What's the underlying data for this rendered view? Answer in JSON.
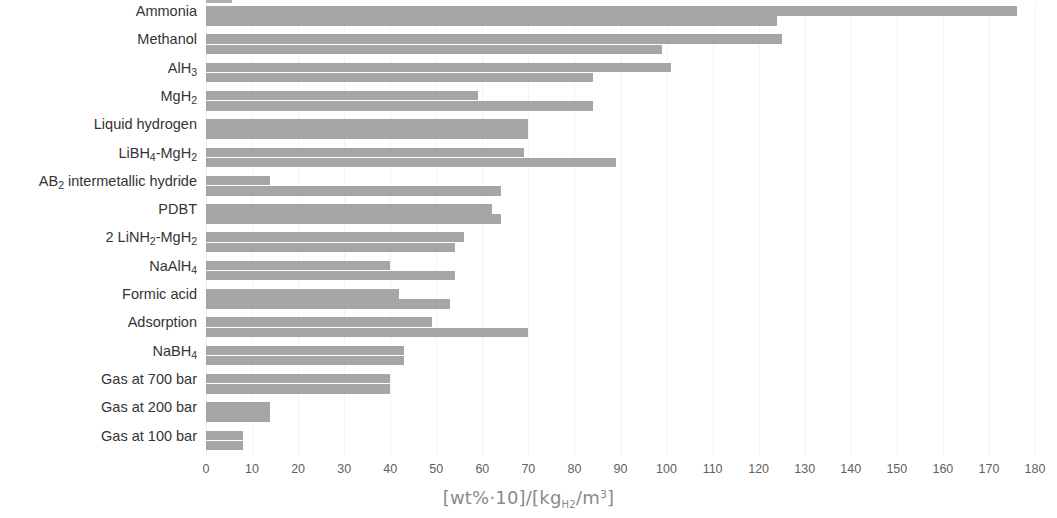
{
  "chart": {
    "type": "bar",
    "orientation": "horizontal-grouped",
    "title": "",
    "xlabel": "[wt%·10]/[kg_H2/m³]",
    "xlabel_parts": {
      "open": "[wt%·10]/[kg",
      "sub": "H2",
      "mid": "/m",
      "sup": "3",
      "close": "]"
    },
    "ylabel": "",
    "xlim": [
      0,
      180
    ],
    "xticks": [
      0,
      10,
      20,
      30,
      40,
      50,
      60,
      70,
      80,
      90,
      100,
      110,
      120,
      130,
      140,
      150,
      160,
      170,
      180
    ],
    "xtick_labels": [
      "0",
      "10",
      "20",
      "30",
      "40",
      "50",
      "60",
      "70",
      "80",
      "90",
      "100",
      "110",
      "120",
      "130",
      "140",
      "150",
      "160",
      "170",
      "180"
    ],
    "grid": true,
    "legend": "none",
    "bar_color": "#a6a6a6",
    "grid_color": "#f2f2f2",
    "axis_text_color": "#616161"
  },
  "chart_data": {
    "type": "bar",
    "title": "",
    "xlabel": "[wt%·10]/[kg_H2/m³]",
    "ylabel": "",
    "xlim": [
      0,
      180
    ],
    "grid": true,
    "legend_position": "none",
    "categories": [
      "Ammonia",
      "Methanol",
      "AlH3",
      "MgH2",
      "Liquid hydrogen",
      "LiBH4-MgH2",
      "AB2 intermetallic hydride",
      "PDBT",
      "2 LiNH2-MgH2",
      "NaAlH4",
      "Formic acid",
      "Adsorption",
      "NaBH4",
      "Gas at 700 bar",
      "Gas at 200 bar",
      "Gas at 100 bar"
    ],
    "series": [
      {
        "name": "volumetric density [kgH2/m3]",
        "values": [
          176,
          125,
          101,
          59,
          70,
          69,
          14,
          62,
          56,
          40,
          42,
          49,
          43,
          40,
          14,
          8
        ]
      },
      {
        "name": "gravimetric density [wt%·10]",
        "values": [
          124,
          99,
          84,
          84,
          70,
          89,
          64,
          64,
          54,
          54,
          53,
          70,
          43,
          40,
          14,
          8
        ]
      }
    ]
  },
  "category_labels": [
    {
      "text": "Ammonia",
      "sub": null
    },
    {
      "text": "Methanol",
      "sub": null
    },
    {
      "text": "AlH",
      "sub": "3"
    },
    {
      "text": "MgH",
      "sub": "2"
    },
    {
      "text": "Liquid hydrogen",
      "sub": null
    },
    {
      "text": "LiBH",
      "sub": "4",
      "text2": "-MgH",
      "sub2": "2"
    },
    {
      "text": "AB",
      "sub": "2",
      "text2": " intermetallic hydride"
    },
    {
      "text": "PDBT",
      "sub": null
    },
    {
      "text": "2 LiNH",
      "sub": "2",
      "text2": "-MgH",
      "sub2": "2"
    },
    {
      "text": "NaAlH",
      "sub": "4"
    },
    {
      "text": "Formic acid",
      "sub": null
    },
    {
      "text": "Adsorption",
      "sub": null
    },
    {
      "text": "NaBH",
      "sub": "4"
    },
    {
      "text": "Gas at 700 bar",
      "sub": null
    },
    {
      "text": "Gas at 200 bar",
      "sub": null
    },
    {
      "text": "Gas at 100 bar",
      "sub": null
    }
  ]
}
